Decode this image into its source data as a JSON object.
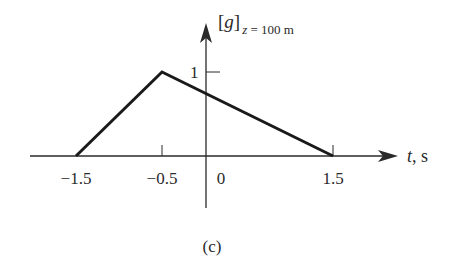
{
  "figure": {
    "panel_label": "(c)",
    "y_axis": {
      "label_main": "[g]",
      "label_sub": "z = 100 m",
      "ticks": [
        {
          "value": 1,
          "label": "1"
        }
      ]
    },
    "x_axis": {
      "label": "t, s",
      "ticks": [
        {
          "value": -1.5,
          "label": "−1.5"
        },
        {
          "value": -0.5,
          "label": "−0.5"
        },
        {
          "value": 0,
          "label": "0"
        },
        {
          "value": 1.5,
          "label": "1.5"
        }
      ]
    },
    "colors": {
      "line": "#1a1a1a",
      "axis": "#2a2a2a",
      "text": "#2a2a2a",
      "background": "#ffffff"
    }
  },
  "chart_data": {
    "type": "line",
    "title": "",
    "xlabel": "t, s",
    "ylabel": "[g]_{z = 100 m}",
    "x": [
      -1.5,
      -0.5,
      1.5
    ],
    "values": [
      0,
      1,
      0
    ],
    "series": [
      {
        "name": "[g] at z = 100 m",
        "x": [
          -1.5,
          -0.5,
          1.5
        ],
        "values": [
          0,
          1,
          0
        ]
      }
    ],
    "xticks": [
      -1.5,
      -0.5,
      0,
      1.5
    ],
    "yticks": [
      1
    ],
    "grid": false,
    "legend": "none",
    "annotation": "(c)"
  }
}
